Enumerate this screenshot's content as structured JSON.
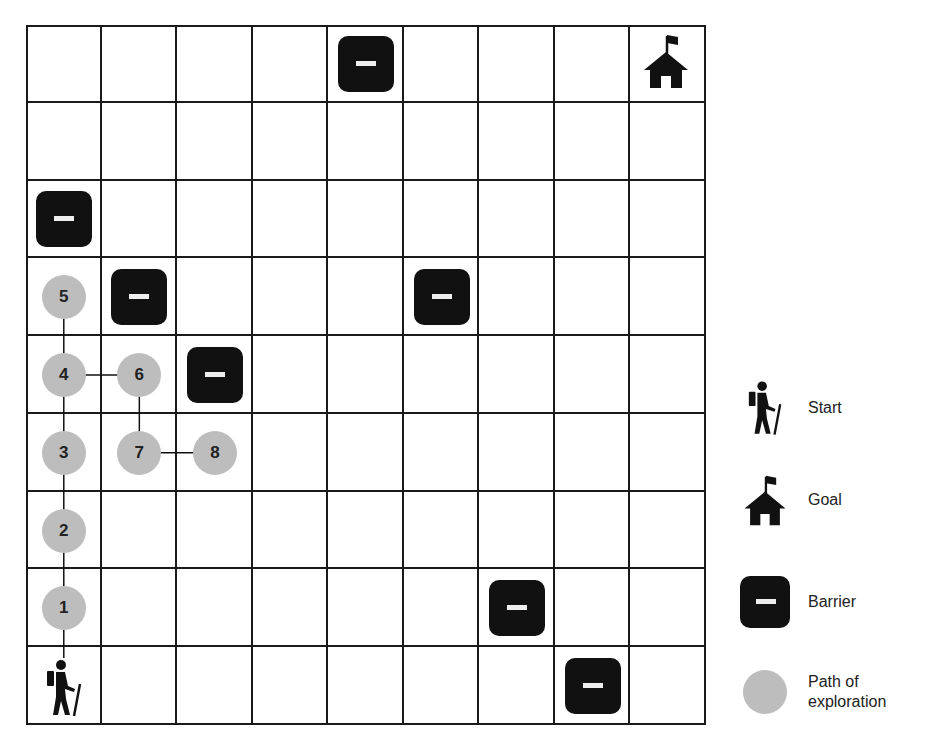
{
  "grid": {
    "rows": 9,
    "cols": 9,
    "start": {
      "row": 8,
      "col": 0
    },
    "goal": {
      "row": 0,
      "col": 8
    },
    "barriers": [
      {
        "row": 0,
        "col": 4
      },
      {
        "row": 2,
        "col": 0
      },
      {
        "row": 3,
        "col": 1
      },
      {
        "row": 3,
        "col": 5
      },
      {
        "row": 4,
        "col": 2
      },
      {
        "row": 7,
        "col": 6
      },
      {
        "row": 8,
        "col": 7
      }
    ],
    "path_nodes": [
      {
        "label": "1",
        "row": 7,
        "col": 0
      },
      {
        "label": "2",
        "row": 6,
        "col": 0
      },
      {
        "label": "3",
        "row": 5,
        "col": 0
      },
      {
        "label": "4",
        "row": 4,
        "col": 0
      },
      {
        "label": "5",
        "row": 3,
        "col": 0
      },
      {
        "label": "6",
        "row": 4,
        "col": 1
      },
      {
        "label": "7",
        "row": 5,
        "col": 1
      },
      {
        "label": "8",
        "row": 5,
        "col": 2
      }
    ],
    "edges": [
      {
        "from": "start",
        "to": "1"
      },
      {
        "from": "1",
        "to": "2"
      },
      {
        "from": "2",
        "to": "3"
      },
      {
        "from": "3",
        "to": "4"
      },
      {
        "from": "4",
        "to": "5"
      },
      {
        "from": "4",
        "to": "6"
      },
      {
        "from": "6",
        "to": "7"
      },
      {
        "from": "7",
        "to": "8"
      }
    ]
  },
  "legend": {
    "items": [
      {
        "icon": "hiker-icon",
        "label": "Start"
      },
      {
        "icon": "house-flag-icon",
        "label": "Goal"
      },
      {
        "icon": "barrier-icon",
        "label": "Barrier"
      },
      {
        "icon": "gray-circle-icon",
        "label": "Path of exploration"
      }
    ],
    "start_label": "Start",
    "goal_label": "Goal",
    "barrier_label": "Barrier",
    "path_label_line1": "Path of",
    "path_label_line2": "exploration"
  },
  "colors": {
    "barrier": "#111111",
    "path_node": "#bdbdbd",
    "grid_line": "#1a1a1a",
    "background": "#ffffff"
  }
}
